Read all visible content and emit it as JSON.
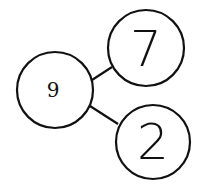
{
  "diagram": {
    "type": "number-bond",
    "whole": {
      "label": "9"
    },
    "parts": [
      {
        "label": "7"
      },
      {
        "label": "2"
      }
    ]
  }
}
